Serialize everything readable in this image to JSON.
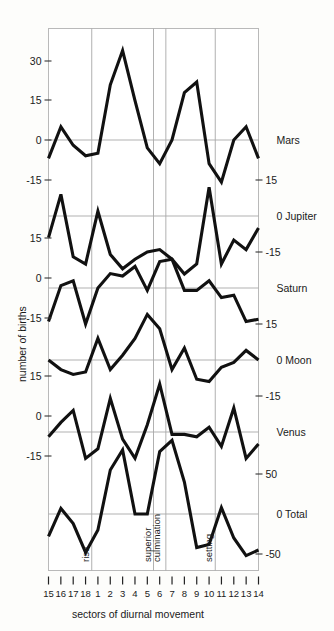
{
  "figure": {
    "ylabel": "number of births",
    "xlabel": "sectors of diurnal movement"
  },
  "xaxis": {
    "ticks": [
      "15",
      "16",
      "17",
      "18",
      "1",
      "2",
      "3",
      "4",
      "5",
      "6",
      "7",
      "8",
      "9",
      "10",
      "11",
      "12",
      "13",
      "14"
    ]
  },
  "annotations": [
    {
      "name": "rise",
      "label": "rise",
      "at_index": 3.5
    },
    {
      "name": "superior",
      "label": "superior",
      "at_index": 8.5
    },
    {
      "name": "culmination",
      "label": "culmination",
      "at_index": 9.3
    },
    {
      "name": "setting",
      "label": "setting",
      "at_index": 13.5
    }
  ],
  "left_axis_labels": [
    {
      "text": "30",
      "y": 61
    },
    {
      "text": "15",
      "y": 100
    },
    {
      "text": "0",
      "y": 140
    },
    {
      "text": "-15",
      "y": 180
    },
    {
      "text": "15",
      "y": 238
    },
    {
      "text": "0",
      "y": 278
    },
    {
      "text": "-15",
      "y": 318
    },
    {
      "text": "15",
      "y": 376
    },
    {
      "text": "0",
      "y": 416
    },
    {
      "text": "-15",
      "y": 456
    }
  ],
  "right_axis_labels": [
    {
      "text": "Mars",
      "y": 140,
      "kind": "series"
    },
    {
      "text": "15",
      "y": 180,
      "kind": "tick"
    },
    {
      "text": "0 Jupiter",
      "y": 216,
      "kind": "series"
    },
    {
      "text": "-15",
      "y": 252,
      "kind": "tick"
    },
    {
      "text": "Saturn",
      "y": 288,
      "kind": "series"
    },
    {
      "text": "15",
      "y": 324,
      "kind": "tick"
    },
    {
      "text": "0 Moon",
      "y": 360,
      "kind": "series"
    },
    {
      "text": "-15",
      "y": 396,
      "kind": "tick"
    },
    {
      "text": "Venus",
      "y": 432,
      "kind": "series"
    },
    {
      "text": "50",
      "y": 474,
      "kind": "tick"
    },
    {
      "text": "0 Total",
      "y": 514,
      "kind": "series"
    },
    {
      "text": "-50",
      "y": 554,
      "kind": "tick"
    }
  ],
  "chart_data": {
    "type": "line",
    "title": "",
    "xlabel": "sectors of diurnal movement",
    "ylabel": "number of births",
    "categories": [
      "15",
      "16",
      "17",
      "18",
      "1",
      "2",
      "3",
      "4",
      "5",
      "6",
      "7",
      "8",
      "9",
      "10",
      "11",
      "12",
      "13",
      "14"
    ],
    "grid": true,
    "legend": "right-axis-labels",
    "panels": [
      {
        "name": "Mars",
        "ylim": [
          -22,
          38
        ],
        "yticks": [
          -15,
          0,
          15,
          30
        ],
        "values": [
          -7,
          5,
          -2,
          -6,
          -5,
          21,
          34,
          15,
          -3,
          -9,
          0,
          18,
          22,
          -9,
          -16,
          0,
          5,
          -7
        ]
      },
      {
        "name": "Jupiter",
        "ylim": [
          -30,
          22
        ],
        "yticks": [
          -15,
          0,
          15
        ],
        "values": [
          -9,
          9,
          -17,
          -20,
          2,
          -16,
          -22,
          -18,
          -15,
          -14,
          -18,
          -26,
          -20,
          12,
          -20,
          -10,
          -14,
          -5
        ]
      },
      {
        "name": "Saturn",
        "ylim": [
          -22,
          20
        ],
        "yticks": [
          -15,
          0,
          15
        ],
        "values": [
          -14,
          1,
          3,
          -15,
          0,
          6,
          5,
          9,
          -1,
          11,
          12,
          -1,
          -1,
          3,
          -4,
          -3,
          -14,
          -13
        ]
      },
      {
        "name": "Moon",
        "ylim": [
          -24,
          22
        ],
        "yticks": [
          -15,
          0,
          15
        ],
        "values": [
          0,
          -4,
          -6,
          -5,
          9,
          -4,
          2,
          9,
          19,
          13,
          -4,
          5,
          -8,
          -9,
          -3,
          -1,
          4,
          0
        ]
      },
      {
        "name": "Venus",
        "ylim": [
          -22,
          20
        ],
        "yticks": [
          -15,
          0,
          15
        ],
        "values": [
          -2,
          4,
          9,
          -11,
          -7,
          14,
          -3,
          -11,
          3,
          20,
          -1,
          -1,
          -2,
          2,
          -6,
          10,
          -11,
          -5
        ]
      },
      {
        "name": "Total",
        "ylim": [
          -70,
          95
        ],
        "yticks": [
          -50,
          0,
          50
        ],
        "values": [
          -28,
          7,
          -12,
          -48,
          -20,
          55,
          80,
          0,
          0,
          78,
          92,
          40,
          -42,
          -38,
          8,
          -30,
          -52,
          -45,
          -20
        ]
      }
    ]
  }
}
